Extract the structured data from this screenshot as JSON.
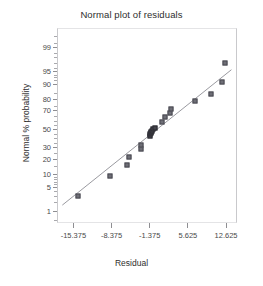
{
  "chart_data": {
    "type": "scatter",
    "title": "Normal plot of residuals",
    "xlabel": "Residual",
    "ylabel": "Normal % probability",
    "grid": false,
    "legend": null,
    "xlim": [
      -18.375,
      14.625
    ],
    "ylim_probability": [
      0.4,
      99.8
    ],
    "yscale": "normal-probability",
    "xticks": [
      "-15.375",
      "-8.375",
      "-1.375",
      "5.625",
      "12.625"
    ],
    "xtick_values": [
      -15.375,
      -8.375,
      -1.375,
      5.625,
      12.625
    ],
    "yticks": [
      "99",
      "95",
      "90",
      "80",
      "70",
      "50",
      "30",
      "20",
      "10",
      "5",
      "1"
    ],
    "ytick_values": [
      99,
      95,
      90,
      80,
      70,
      50,
      30,
      20,
      10,
      5,
      1
    ],
    "points": [
      {
        "x": -14.5,
        "y": 3.0
      },
      {
        "x": -8.6,
        "y": 9.5
      },
      {
        "x": -5.6,
        "y": 16.0
      },
      {
        "x": -5.2,
        "y": 22.0
      },
      {
        "x": -3.0,
        "y": 29.0
      },
      {
        "x": -2.9,
        "y": 33.0
      },
      {
        "x": -1.4,
        "y": 43.0
      },
      {
        "x": -1.3,
        "y": 45.0
      },
      {
        "x": -1.2,
        "y": 46.0
      },
      {
        "x": -1.1,
        "y": 47.0
      },
      {
        "x": -0.9,
        "y": 48.0
      },
      {
        "x": -0.7,
        "y": 50.0
      },
      {
        "x": -0.5,
        "y": 52.0
      },
      {
        "x": 0.8,
        "y": 58.0
      },
      {
        "x": 1.5,
        "y": 64.0
      },
      {
        "x": 2.3,
        "y": 68.0
      },
      {
        "x": 2.5,
        "y": 72.0
      },
      {
        "x": 6.9,
        "y": 79.0
      },
      {
        "x": 9.8,
        "y": 84.0
      },
      {
        "x": 11.9,
        "y": 91.0
      },
      {
        "x": 12.5,
        "y": 97.0
      }
    ],
    "reference_line": {
      "x_start": -17.4,
      "y_start": 1.6,
      "x_end": 13.6,
      "y_end": 95.5,
      "description": "normal reference line"
    }
  },
  "colors": {
    "marker_fill": "#6e6e76",
    "marker_edge": "#4a4a52",
    "line": "#9a9aa0",
    "axis": "#8e8e92",
    "text": "#2e2e2e",
    "background": "#ffffff"
  }
}
